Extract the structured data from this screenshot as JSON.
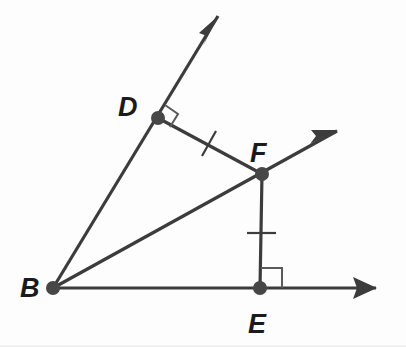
{
  "figure": {
    "kind": "geometry-diagram",
    "width": 406,
    "height": 347,
    "background_color": "#fdfdfd",
    "line_color": "#3c3c3c",
    "vertex_color": "#474747",
    "right_angle_color": "#5a5a5a",
    "label_color": "#1b1b1b"
  },
  "points": {
    "B": {
      "label": "B",
      "x": 53,
      "y": 288,
      "label_x": 22,
      "label_y": 297
    },
    "D": {
      "label": "D",
      "x": 158,
      "y": 118,
      "label_x": 120,
      "label_y": 114
    },
    "F": {
      "label": "F",
      "x": 262,
      "y": 174,
      "label_x": 250,
      "label_y": 161
    },
    "E": {
      "label": "E",
      "x": 260,
      "y": 288,
      "label_x": 248,
      "label_y": 333
    }
  },
  "rays": [
    {
      "name": "ray-BD",
      "from": "B",
      "through": "D",
      "start_x": 53,
      "start_y": 288,
      "end_x": 218,
      "end_y": 16,
      "stroke_width": 3.2,
      "arrow": true
    },
    {
      "name": "ray-BF",
      "from": "B",
      "through": "F",
      "start_x": 53,
      "start_y": 288,
      "end_x": 337,
      "end_y": 131,
      "stroke_width": 3.2,
      "arrow": true
    },
    {
      "name": "ray-BE",
      "from": "B",
      "through": "E",
      "start_x": 53,
      "start_y": 288,
      "end_x": 376,
      "end_y": 288,
      "stroke_width": 3.2,
      "arrow": true
    }
  ],
  "segments": [
    {
      "name": "segment-DF",
      "from": "D",
      "to": "F",
      "x1": 158,
      "y1": 118,
      "x2": 262,
      "y2": 174,
      "stroke_width": 3.2,
      "congruent": true
    },
    {
      "name": "segment-FE",
      "from": "F",
      "to": "E",
      "x1": 262,
      "y1": 174,
      "x2": 260,
      "y2": 288,
      "stroke_width": 3.2,
      "congruent": true
    }
  ],
  "tick_marks": [
    {
      "name": "tick-segment-DF",
      "on_segment": "DF",
      "x1": 202,
      "y1": 156,
      "x2": 216,
      "y2": 131
    },
    {
      "name": "tick-segment-FE",
      "on_segment": "FE",
      "x1": 247,
      "y1": 233,
      "x2": 276,
      "y2": 233
    }
  ],
  "right_angles": [
    {
      "name": "right-angle-at-D",
      "at_point": "D",
      "path": "M 165,105 L 178,114 L 170,127"
    },
    {
      "name": "right-angle-at-E",
      "at_point": "E",
      "path": "M 261,268 L 282,268 L 282,288"
    }
  ],
  "arrowheads": [
    {
      "name": "arrowhead-ray-BD",
      "points": "218,16 200,34 206,36 203,45"
    },
    {
      "name": "arrowhead-ray-BF",
      "points": "337,131 312,131 316,136 311,143"
    },
    {
      "name": "arrowhead-ray-BE",
      "points": "376,288 354,278 357,288 354,298"
    }
  ],
  "labels": [
    {
      "name": "vertex-label-B",
      "text": "B"
    },
    {
      "name": "vertex-label-D",
      "text": "D"
    },
    {
      "name": "vertex-label-F",
      "text": "F"
    },
    {
      "name": "vertex-label-E",
      "text": "E"
    }
  ]
}
